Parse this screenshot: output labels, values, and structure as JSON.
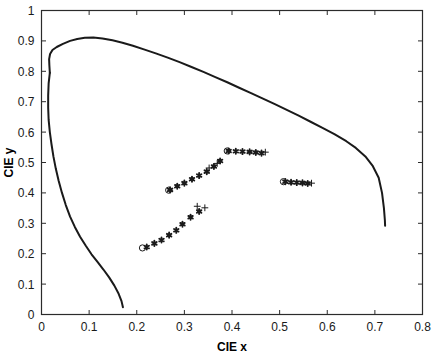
{
  "chart_data": {
    "type": "scatter",
    "title": "",
    "xlabel": "CIE x",
    "ylabel": "CIE y",
    "xlim": [
      0,
      0.8
    ],
    "ylim": [
      0,
      1
    ],
    "xticks": [
      0,
      0.1,
      0.2,
      0.3,
      0.4,
      0.5,
      0.6,
      0.7,
      0.8
    ],
    "xticklabels": [
      "0",
      "0.1",
      "0.2",
      "0.3",
      "0.4",
      "0.5",
      "0.6",
      "0.7",
      "0.8"
    ],
    "yticks": [
      0,
      0.1,
      0.2,
      0.3,
      0.4,
      0.5,
      0.6,
      0.7,
      0.8,
      0.9,
      1
    ],
    "yticklabels": [
      "0",
      "0.1",
      "0.2",
      "0.3",
      "0.4",
      "0.5",
      "0.6",
      "0.7",
      "0.8",
      "0.9",
      "1"
    ],
    "grid": false,
    "legend": "none",
    "line_color": "#1a1a1a",
    "marker_color": "#1a1a1a",
    "series": [
      {
        "name": "spectral-locus",
        "type": "line",
        "points": [
          [
            0.0175,
            0.795
          ],
          [
            0.0165,
            0.82
          ],
          [
            0.016,
            0.84
          ],
          [
            0.018,
            0.857
          ],
          [
            0.023,
            0.87
          ],
          [
            0.032,
            0.88
          ],
          [
            0.045,
            0.89
          ],
          [
            0.06,
            0.9
          ],
          [
            0.075,
            0.906
          ],
          [
            0.091,
            0.91
          ],
          [
            0.109,
            0.911
          ],
          [
            0.128,
            0.908
          ],
          [
            0.149,
            0.902
          ],
          [
            0.17,
            0.894
          ],
          [
            0.192,
            0.884
          ],
          [
            0.215,
            0.872
          ],
          [
            0.24,
            0.859
          ],
          [
            0.265,
            0.845
          ],
          [
            0.29,
            0.83
          ],
          [
            0.315,
            0.814
          ],
          [
            0.34,
            0.798
          ],
          [
            0.365,
            0.781
          ],
          [
            0.39,
            0.764
          ],
          [
            0.415,
            0.746
          ],
          [
            0.44,
            0.728
          ],
          [
            0.465,
            0.71
          ],
          [
            0.49,
            0.692
          ],
          [
            0.515,
            0.673
          ],
          [
            0.54,
            0.654
          ],
          [
            0.565,
            0.634
          ],
          [
            0.59,
            0.614
          ],
          [
            0.615,
            0.593
          ],
          [
            0.64,
            0.57
          ],
          [
            0.66,
            0.548
          ],
          [
            0.68,
            0.52
          ],
          [
            0.695,
            0.49
          ],
          [
            0.708,
            0.45
          ],
          [
            0.715,
            0.4
          ],
          [
            0.719,
            0.35
          ],
          [
            0.721,
            0.31
          ],
          [
            0.7215,
            0.292
          ]
        ]
      },
      {
        "name": "purple-line",
        "type": "line",
        "points": [
          [
            0.0175,
            0.795
          ],
          [
            0.015,
            0.76
          ],
          [
            0.014,
            0.72
          ],
          [
            0.014,
            0.68
          ],
          [
            0.015,
            0.64
          ],
          [
            0.0175,
            0.6
          ],
          [
            0.021,
            0.56
          ],
          [
            0.025,
            0.52
          ],
          [
            0.03,
            0.48
          ],
          [
            0.036,
            0.44
          ],
          [
            0.043,
            0.4
          ],
          [
            0.051,
            0.36
          ],
          [
            0.06,
            0.322
          ],
          [
            0.07,
            0.288
          ],
          [
            0.081,
            0.256
          ],
          [
            0.093,
            0.226
          ],
          [
            0.105,
            0.198
          ],
          [
            0.118,
            0.172
          ],
          [
            0.13,
            0.148
          ],
          [
            0.142,
            0.122
          ],
          [
            0.153,
            0.095
          ],
          [
            0.162,
            0.068
          ],
          [
            0.168,
            0.044
          ],
          [
            0.171,
            0.024
          ]
        ]
      },
      {
        "name": "track-a-circle",
        "type": "marker",
        "marker": "circle",
        "points": [
          [
            0.212,
            0.219
          ]
        ]
      },
      {
        "name": "track-a-asterisks",
        "type": "marker",
        "marker": "asterisk",
        "points": [
          [
            0.221,
            0.222
          ],
          [
            0.237,
            0.234
          ],
          [
            0.252,
            0.245
          ],
          [
            0.268,
            0.261
          ],
          [
            0.283,
            0.277
          ],
          [
            0.296,
            0.297
          ],
          [
            0.313,
            0.32
          ],
          [
            0.331,
            0.339
          ]
        ]
      },
      {
        "name": "track-a-plus",
        "type": "marker",
        "marker": "plus",
        "points": [
          [
            0.327,
            0.356
          ],
          [
            0.343,
            0.351
          ]
        ]
      },
      {
        "name": "track-b-circle",
        "type": "marker",
        "marker": "circle",
        "points": [
          [
            0.267,
            0.409
          ]
        ]
      },
      {
        "name": "track-b-asterisks",
        "type": "marker",
        "marker": "asterisk",
        "points": [
          [
            0.27,
            0.41
          ],
          [
            0.285,
            0.422
          ],
          [
            0.3,
            0.432
          ],
          [
            0.316,
            0.445
          ],
          [
            0.331,
            0.457
          ],
          [
            0.347,
            0.47
          ],
          [
            0.362,
            0.487
          ],
          [
            0.375,
            0.505
          ]
        ]
      },
      {
        "name": "track-b-plus",
        "type": "marker",
        "marker": "plus",
        "points": [
          [
            0.352,
            0.482
          ],
          [
            0.369,
            0.497
          ]
        ]
      },
      {
        "name": "track-c-circle",
        "type": "marker",
        "marker": "circle",
        "points": [
          [
            0.39,
            0.538
          ]
        ]
      },
      {
        "name": "track-c-asterisks",
        "type": "marker",
        "marker": "asterisk",
        "points": [
          [
            0.393,
            0.538
          ],
          [
            0.408,
            0.537
          ],
          [
            0.422,
            0.536
          ],
          [
            0.437,
            0.535
          ],
          [
            0.45,
            0.533
          ],
          [
            0.462,
            0.531
          ]
        ]
      },
      {
        "name": "track-c-plus",
        "type": "marker",
        "marker": "plus",
        "points": [
          [
            0.47,
            0.534
          ]
        ]
      },
      {
        "name": "track-d-circle",
        "type": "marker",
        "marker": "circle",
        "points": [
          [
            0.508,
            0.437
          ]
        ]
      },
      {
        "name": "track-d-asterisks",
        "type": "marker",
        "marker": "asterisk",
        "points": [
          [
            0.512,
            0.437
          ],
          [
            0.524,
            0.435
          ],
          [
            0.536,
            0.434
          ],
          [
            0.548,
            0.433
          ],
          [
            0.559,
            0.431
          ]
        ]
      },
      {
        "name": "track-d-plus",
        "type": "marker",
        "marker": "plus",
        "points": [
          [
            0.567,
            0.432
          ]
        ]
      }
    ]
  }
}
